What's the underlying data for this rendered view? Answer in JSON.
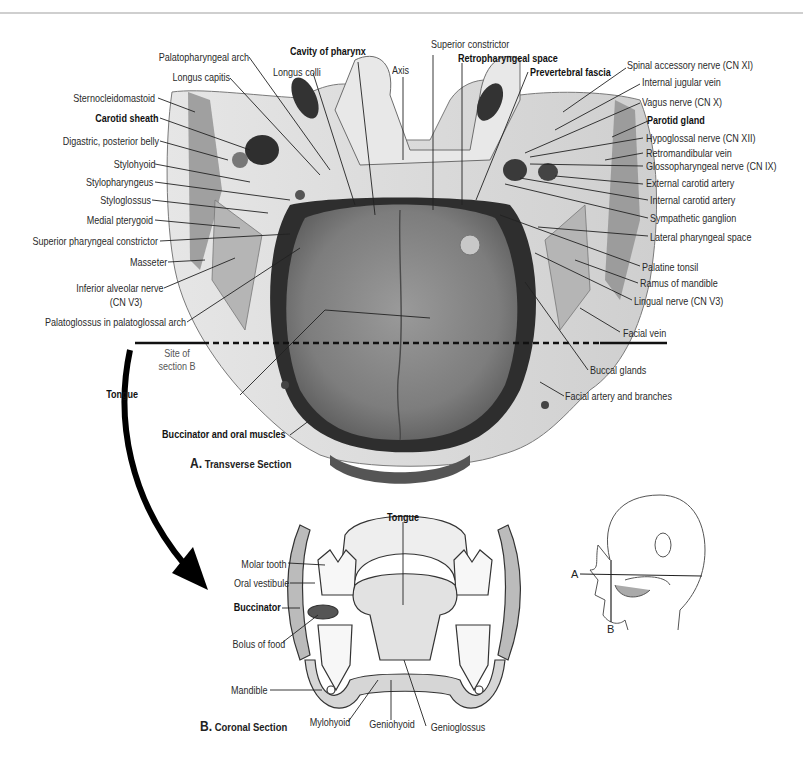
{
  "figure": {
    "transverse": {
      "caption_letter": "A.",
      "caption_text": "Transverse Section",
      "labels_left": [
        {
          "text": "Palatopharyngeal arch",
          "bold": false
        },
        {
          "text": "Longus capitis",
          "bold": false
        },
        {
          "text": "Sternocleidomastoid",
          "bold": false
        },
        {
          "text": "Carotid sheath",
          "bold": true
        },
        {
          "text": "Digastric, posterior belly",
          "bold": false
        },
        {
          "text": "Stylohyoid",
          "bold": false
        },
        {
          "text": "Stylopharyngeus",
          "bold": false
        },
        {
          "text": "Styloglossus",
          "bold": false
        },
        {
          "text": "Medial pterygoid",
          "bold": false
        },
        {
          "text": "Superior pharyngeal constrictor",
          "bold": false
        },
        {
          "text": "Masseter",
          "bold": false
        },
        {
          "text": "Inferior alveolar nerve",
          "bold": false
        },
        {
          "text": "(CN V3)",
          "bold": false
        },
        {
          "text": "Palatoglossus in palatoglossal arch",
          "bold": false
        },
        {
          "text": "Tongue",
          "bold": true
        },
        {
          "text": "Buccinator and oral muscles",
          "bold": true
        }
      ],
      "labels_top": [
        {
          "text": "Cavity of pharynx",
          "bold": true
        },
        {
          "text": "Longus colli",
          "bold": false
        },
        {
          "text": "Axis",
          "bold": false
        },
        {
          "text": "Superior constrictor",
          "bold": false
        },
        {
          "text": "Retropharyngeal space",
          "bold": true
        },
        {
          "text": "Prevertebral fascia",
          "bold": true
        }
      ],
      "labels_right": [
        {
          "text": "Spinal accessory nerve (CN XI)",
          "bold": false
        },
        {
          "text": "Internal jugular vein",
          "bold": false
        },
        {
          "text": "Vagus nerve (CN X)",
          "bold": false
        },
        {
          "text": "Parotid gland",
          "bold": true
        },
        {
          "text": "Hypoglossal nerve (CN XII)",
          "bold": false
        },
        {
          "text": "Retromandibular vein",
          "bold": false
        },
        {
          "text": "Glossopharyngeal nerve (CN IX)",
          "bold": false
        },
        {
          "text": "External carotid artery",
          "bold": false
        },
        {
          "text": "Internal carotid artery",
          "bold": false
        },
        {
          "text": "Sympathetic ganglion",
          "bold": false
        },
        {
          "text": "Lateral pharyngeal space",
          "bold": false
        },
        {
          "text": "Palatine tonsil",
          "bold": false
        },
        {
          "text": "Ramus of mandible",
          "bold": false
        },
        {
          "text": "Lingual nerve (CN V3)",
          "bold": false
        },
        {
          "text": "Facial vein",
          "bold": false
        },
        {
          "text": "Buccal glands",
          "bold": false
        },
        {
          "text": "Facial artery and branches",
          "bold": false
        }
      ],
      "site_label_line1": "Site of",
      "site_label_line2": "section B"
    },
    "coronal": {
      "caption_letter": "B.",
      "caption_text": "Coronal Section",
      "labels": [
        {
          "text": "Tongue",
          "bold": true
        },
        {
          "text": "Molar tooth",
          "bold": false
        },
        {
          "text": "Oral vestibule",
          "bold": false
        },
        {
          "text": "Buccinator",
          "bold": true
        },
        {
          "text": "Bolus of food",
          "bold": false
        },
        {
          "text": "Mandible",
          "bold": false
        },
        {
          "text": "Mylohyoid",
          "bold": false
        },
        {
          "text": "Geniohyoid",
          "bold": false
        },
        {
          "text": "Genioglossus",
          "bold": false
        }
      ]
    },
    "orientation_inset": {
      "plane_a": "A",
      "plane_b": "B"
    },
    "colors": {
      "ink": "#222222",
      "tongue": "#8a8a8a",
      "cavity": "#2e2e2e",
      "tissue_light": "#d9d9d9",
      "tissue_mid": "#a8a8a8",
      "topline": "#cfcfcf"
    }
  }
}
